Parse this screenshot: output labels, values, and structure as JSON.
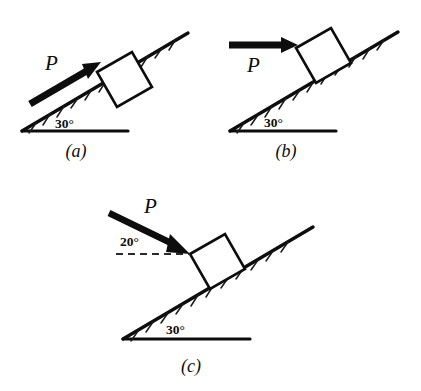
{
  "figure": {
    "background_color": "#ffffff",
    "ink_color": "#0d0d0d"
  },
  "panels": [
    {
      "id": "a",
      "caption": "(a)",
      "force_label": "P",
      "incline_angle_label": "30°",
      "incline_angle_value": 30,
      "force_direction": "up the incline, parallel to the 30° surface",
      "force_angle_from_horizontal": 30,
      "has_dashed_reference": false,
      "reference_angle_label": ""
    },
    {
      "id": "b",
      "caption": "(b)",
      "force_label": "P",
      "incline_angle_label": "30°",
      "incline_angle_value": 30,
      "force_direction": "horizontal, pointing right into the block",
      "force_angle_from_horizontal": 0,
      "has_dashed_reference": false,
      "reference_angle_label": ""
    },
    {
      "id": "c",
      "caption": "(c)",
      "force_label": "P",
      "incline_angle_label": "30°",
      "incline_angle_value": 30,
      "force_direction": "directed down-right at 20° below horizontal",
      "force_angle_from_horizontal": -20,
      "has_dashed_reference": true,
      "reference_angle_label": "20°"
    }
  ]
}
